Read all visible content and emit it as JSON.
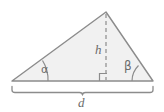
{
  "diagram": {
    "type": "triangle-with-height-and-base",
    "background_color": "#ffffff",
    "stroke_color": "#8c8c8c",
    "fill_color": "#f1f1f1",
    "label_color": "#6b6b6b",
    "labels": {
      "height": "h",
      "base": "d",
      "angle_left": "α",
      "angle_right": "β"
    },
    "markers": {
      "right_angle": "right-angle-square",
      "height_line_style": "dashed",
      "base_measure_style": "curly-brace"
    },
    "geometry": {
      "vertex_left": [
        12,
        81
      ],
      "vertex_right": [
        153,
        81
      ],
      "vertex_apex": [
        106,
        12
      ],
      "foot_of_height": [
        106,
        81
      ],
      "brace_left": [
        12,
        88
      ],
      "brace_right": [
        153,
        88
      ]
    }
  }
}
